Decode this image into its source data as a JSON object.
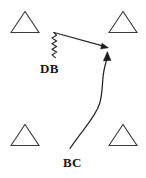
{
  "diagram": {
    "background_color": "#ffffff",
    "width": 146,
    "height": 178,
    "line_color": "#262626",
    "cone_color": "#3a3a3a",
    "label_color": "#181818",
    "cones": [
      {
        "name": "cone-top-left",
        "label": "triangle",
        "cx": 25,
        "cy": 22,
        "half_width": 14,
        "height": 21
      },
      {
        "name": "cone-top-right",
        "label": "triangle",
        "cx": 123,
        "cy": 22,
        "half_width": 14,
        "height": 21
      },
      {
        "name": "cone-bottom-left",
        "label": "triangle",
        "cx": 25,
        "cy": 135,
        "half_width": 14,
        "height": 21
      },
      {
        "name": "cone-bottom-right",
        "label": "triangle",
        "cx": 123,
        "cy": 135,
        "half_width": 14,
        "height": 21
      }
    ],
    "labels": {
      "db": "DB",
      "bc": "BC"
    },
    "routes": [
      {
        "name": "db-route",
        "player": "DB",
        "style": "zigzag-then-straight-arrow",
        "zigzag_segment": {
          "x": 54,
          "y_start": 32,
          "y_end": 58,
          "amplitude": 2.6,
          "cycles": 9
        },
        "straight_segment": {
          "x1": 54,
          "y1": 32,
          "x2": 107,
          "y2": 47
        },
        "arrow_tip": {
          "x": 108,
          "y": 48
        },
        "arrow_direction": "right-down"
      },
      {
        "name": "bc-route",
        "player": "BC",
        "style": "curved-arrow",
        "start": {
          "x": 70,
          "y": 148
        },
        "end": {
          "x": 107,
          "y": 54
        },
        "arrow_tip": {
          "x": 107,
          "y": 52
        },
        "arrow_direction": "up"
      }
    ]
  }
}
